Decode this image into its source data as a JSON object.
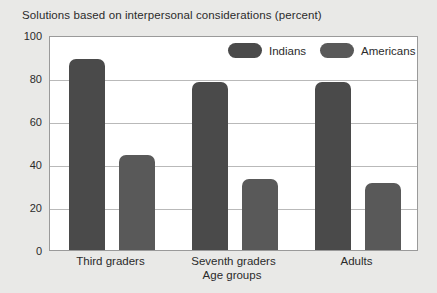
{
  "chart_data": {
    "type": "bar",
    "title": "Solutions based on interpersonal considerations (percent)",
    "xlabel": "Age groups",
    "ylabel": "",
    "categories": [
      "Third graders",
      "Seventh graders",
      "Adults"
    ],
    "series": [
      {
        "name": "Indians",
        "values": [
          89,
          78,
          78
        ],
        "color": "#4a4a4a"
      },
      {
        "name": "Americans",
        "values": [
          44,
          33,
          31
        ],
        "color": "#595959"
      }
    ],
    "ylim": [
      0,
      100
    ],
    "yticks": [
      0,
      20,
      40,
      60,
      80,
      100
    ],
    "ytick_labels": [
      "0",
      "20",
      "40",
      "60",
      "80",
      "100"
    ],
    "grid": "horizontal",
    "legend_position": "top-right-inside"
  },
  "colors": {
    "page_background": "#e9e9e7",
    "plot_background": "#ffffff",
    "gridline": "#b9b9b9",
    "axis": "#9a9a9a",
    "text": "#2b2b2b"
  }
}
